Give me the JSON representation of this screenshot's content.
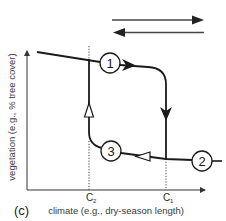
{
  "figure": {
    "panel_label": "(c)",
    "x_axis_label": "climate (e.g., dry-season length)",
    "y_axis_label": "vegetation (e.g., % tree cover)",
    "thresholds": [
      {
        "name": "C",
        "sub": "2"
      },
      {
        "name": "C",
        "sub": "1"
      }
    ],
    "states": [
      {
        "label": "1"
      },
      {
        "label": "2"
      },
      {
        "label": "3"
      }
    ],
    "legend_arrows": [
      {
        "direction": "right"
      },
      {
        "direction": "left"
      }
    ],
    "colors": {
      "line": "#1a1a1a",
      "axis": "#333333",
      "dotted": "#444444"
    }
  }
}
